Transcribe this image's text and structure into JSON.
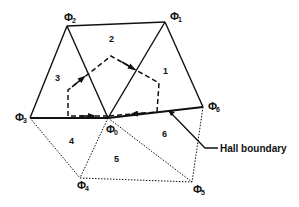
{
  "diagram": {
    "vertices": [
      {
        "id": "phi0",
        "label": "Φ",
        "sub": "0",
        "x": 108,
        "y": 118
      },
      {
        "id": "phi1",
        "label": "Φ",
        "sub": "1",
        "x": 165,
        "y": 22
      },
      {
        "id": "phi2",
        "label": "Φ",
        "sub": "2",
        "x": 67,
        "y": 26
      },
      {
        "id": "phi3",
        "label": "Φ",
        "sub": "3",
        "x": 30,
        "y": 118
      },
      {
        "id": "phi4",
        "label": "Φ",
        "sub": "4",
        "x": 80,
        "y": 178
      },
      {
        "id": "phi5",
        "label": "Φ",
        "sub": "5",
        "x": 192,
        "y": 182
      },
      {
        "id": "phi6",
        "label": "Φ",
        "sub": "6",
        "x": 203,
        "y": 107
      }
    ],
    "regions": [
      {
        "id": "1",
        "label": "1"
      },
      {
        "id": "2",
        "label": "2"
      },
      {
        "id": "3",
        "label": "3"
      },
      {
        "id": "4",
        "label": "4"
      },
      {
        "id": "5",
        "label": "5"
      },
      {
        "id": "6",
        "label": "6"
      }
    ],
    "annotation": {
      "label": "Hall boundary"
    },
    "line_color": "#111111"
  }
}
